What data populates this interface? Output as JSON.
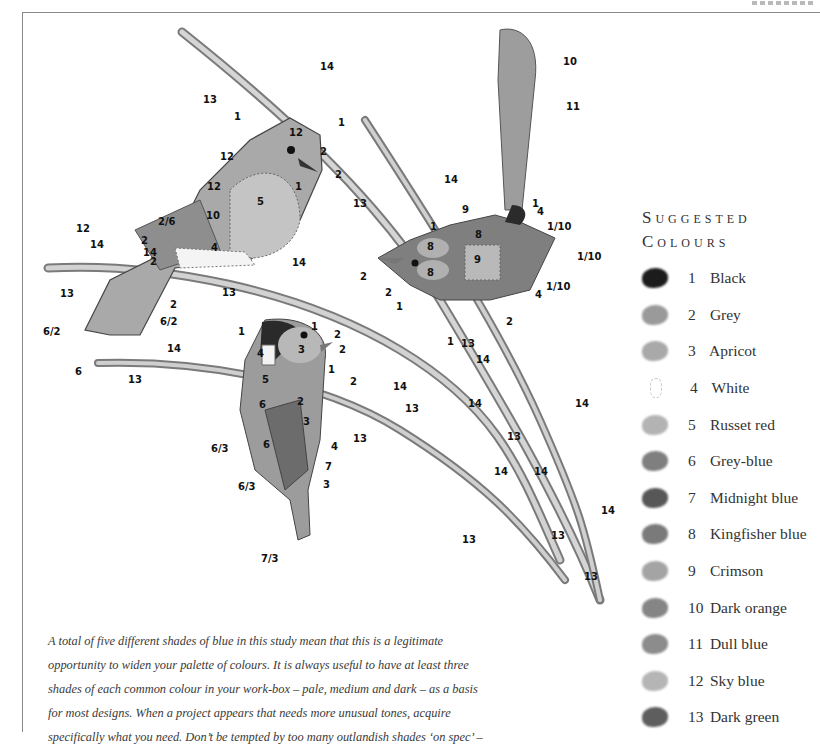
{
  "palette": {
    "title_line1": "Suggested",
    "title_line2": "Colours",
    "items": [
      {
        "number": "1",
        "name": "Black",
        "swatch": "#1c1c1c"
      },
      {
        "number": "2",
        "name": "Grey",
        "swatch": "#9a9a9a"
      },
      {
        "number": "3",
        "name": "Apricot",
        "swatch": "#a9a9a9"
      },
      {
        "number": "4",
        "name": "White",
        "swatch": "#ffffff"
      },
      {
        "number": "5",
        "name": "Russet red",
        "swatch": "#b3b3b3"
      },
      {
        "number": "6",
        "name": "Grey-blue",
        "swatch": "#7f7f7f"
      },
      {
        "number": "7",
        "name": "Midnight blue",
        "swatch": "#575757"
      },
      {
        "number": "8",
        "name": "Kingfisher blue",
        "swatch": "#7a7a7a"
      },
      {
        "number": "9",
        "name": "Crimson",
        "swatch": "#a4a4a4"
      },
      {
        "number": "10",
        "name": "Dark orange",
        "swatch": "#858585"
      },
      {
        "number": "11",
        "name": "Dull blue",
        "swatch": "#8c8c8c"
      },
      {
        "number": "12",
        "name": "Sky blue",
        "swatch": "#b5b5b5"
      },
      {
        "number": "13",
        "name": "Dark green",
        "swatch": "#5e5e5e"
      }
    ]
  },
  "caption": {
    "lines": [
      "A total of five different shades of blue in this study mean that this is a legitimate",
      "opportunity to widen your palette of colours. It is always useful to have at least three",
      "shades of each common colour in your work-box – pale, medium and dark – as a basis",
      "for most designs. When a project appears that needs more unusual tones, acquire",
      "specifically what you need. Don’t be tempted by too many outlandish shades ‘on spec’ –"
    ]
  },
  "illustration": {
    "labels": {
      "robin": [
        "1",
        "12",
        "1",
        "2",
        "2",
        "1",
        "12",
        "12",
        "5",
        "10",
        "12",
        "2/6",
        "4",
        "2",
        "14",
        "2",
        "2",
        "12",
        "14",
        "13",
        "6/2",
        "6/2",
        "6",
        "13",
        "14"
      ],
      "wren": [
        "10",
        "11",
        "1",
        "4",
        "1/10",
        "9",
        "8",
        "1",
        "9",
        "8",
        "8",
        "1/10",
        "2",
        "2",
        "1",
        "1/10",
        "4",
        "2",
        "1",
        "13",
        "14",
        "14",
        "13"
      ],
      "tit": [
        "1",
        "1",
        "2",
        "2",
        "3",
        "4",
        "5",
        "1",
        "6",
        "2",
        "2",
        "3",
        "6/3",
        "6",
        "4",
        "7",
        "6/3",
        "3",
        "7/3",
        "14",
        "13",
        "14",
        "13"
      ],
      "branches": [
        "14",
        "13",
        "14",
        "13",
        "14",
        "14",
        "13",
        "14",
        "13",
        "14",
        "13",
        "14"
      ]
    }
  }
}
